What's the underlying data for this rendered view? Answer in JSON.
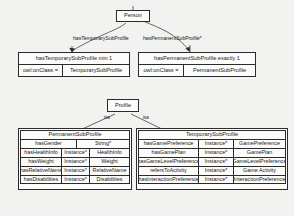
{
  "diagram": {
    "type": "uml-ontology-class-diagram",
    "background_color": "#f2f2f0",
    "line_color": "#2b2b2b",
    "box_fill": "#fbfbfa"
  },
  "person": {
    "label": "Person"
  },
  "profile": {
    "label": "Profile"
  },
  "edges": {
    "temporary_label": "hasTemporarySubProfile",
    "permanent_label": "hasPermanentSubProfile*",
    "isa_left": "isa",
    "isa_right": "isa"
  },
  "restrictions": [
    {
      "name": "temporary-restriction",
      "header": "hasTemporarySubProfile min 1",
      "key": "owl:onClass =",
      "value": "TemporarySubProfile"
    },
    {
      "name": "permanent-restriction",
      "header": "hasPermanentSubProfile exactly 1",
      "key": "owl:onClass =",
      "value": "PermanentSubProfile"
    }
  ],
  "permanent_table": {
    "header": "PermanentSubProfile",
    "rows": [
      {
        "property": "hasGender",
        "instance": "",
        "range": "String*",
        "merged": true
      },
      {
        "property": "hasHealthInfo",
        "instance": "Instance*",
        "range": "HealthInfo",
        "merged": false
      },
      {
        "property": "hasWeight",
        "instance": "Instance*",
        "range": "Weight",
        "merged": false
      },
      {
        "property": "hasRelativeName",
        "instance": "Instance*",
        "range": "RelativeName",
        "merged": false
      },
      {
        "property": "hasDisabilities",
        "instance": "Instance*",
        "range": "Disabilities",
        "merged": false
      }
    ]
  },
  "temporary_table": {
    "header": "TemporarySubProfile",
    "rows": [
      {
        "property": "hasGamePreference",
        "instance": "Instance*",
        "range": "GamePreference",
        "merged": false
      },
      {
        "property": "hasGamePlan",
        "instance": "Instance*",
        "range": "GamePlan",
        "merged": false
      },
      {
        "property": "hasGameLevelPreference",
        "instance": "Instance*",
        "range": "GameLevelPreference",
        "merged": false
      },
      {
        "property": "refersToActivity",
        "instance": "Instance*",
        "range": "Game Activity",
        "merged": false
      },
      {
        "property": "hasInteractionPreference",
        "instance": "Instance*",
        "range": "InteractionPreference",
        "merged": false
      }
    ]
  }
}
